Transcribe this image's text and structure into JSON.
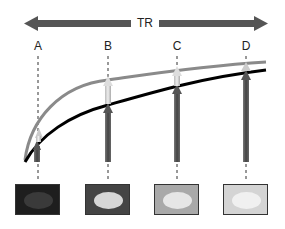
{
  "title_axis": {
    "label": "TR",
    "arrow_color": "#555555"
  },
  "points": [
    {
      "label": "A",
      "x": 38,
      "box_color": "#1e1e1e",
      "ellipse_color": "#3a3a3a",
      "arrow_top_gray": 128,
      "arrow_top_black": 142
    },
    {
      "label": "B",
      "x": 108,
      "box_color": "#444444",
      "ellipse_color": "#d6d6d6",
      "arrow_top_gray": 78,
      "arrow_top_black": 104
    },
    {
      "label": "C",
      "x": 177,
      "box_color": "#a9a9a9",
      "ellipse_color": "#e6e6e6",
      "arrow_top_gray": 68,
      "arrow_top_black": 84
    },
    {
      "label": "D",
      "x": 246,
      "box_color": "#d4d4d4",
      "ellipse_color": "#f0f0f0",
      "arrow_top_gray": 62,
      "arrow_top_black": 70
    }
  ],
  "curves": [
    {
      "name": "gray-curve",
      "color": "#8a8a8a"
    },
    {
      "name": "black-curve",
      "color": "#000000"
    }
  ]
}
